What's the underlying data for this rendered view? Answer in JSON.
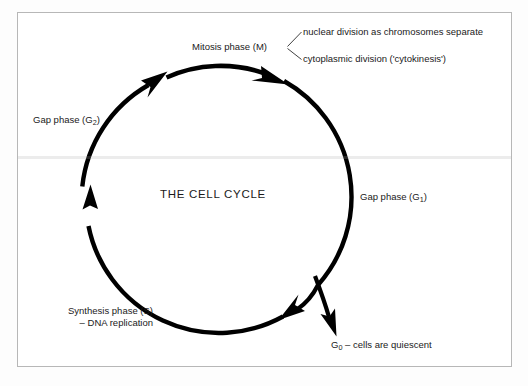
{
  "figure": {
    "title": "THE CELL CYCLE",
    "background_color": "#ffffff",
    "frame_color": "#b7b7b7",
    "stroke_color": "#000000"
  },
  "labels": {
    "mitosis": "Mitosis phase (M)",
    "nuclear_division": "nuclear division as chromosomes separate",
    "cytokinesis": "cytoplasmic division ('cytokinesis')",
    "gap_g2_text": "Gap phase (G",
    "gap_g2_sub": "2",
    "gap_g2_close": ")",
    "gap_g1_text": "Gap phase (G",
    "gap_g1_sub": "1",
    "gap_g1_close": ")",
    "synthesis_line1": "Synthesis phase (S)",
    "synthesis_line2": "– DNA replication",
    "g0_sub": "0",
    "g0_prefix": "G",
    "g0_text": "– cells are quiescent"
  },
  "diagram": {
    "type": "cycle",
    "center_x": 215,
    "center_y": 199,
    "radius": 133,
    "stroke_width": 4.2,
    "phases": [
      {
        "name": "Mitosis phase (M)",
        "symbol": "M",
        "arc_start_deg": 250,
        "arc_end_deg": 290
      },
      {
        "name": "Gap phase (G1)",
        "symbol": "G1",
        "arc_start_deg": 295,
        "arc_end_deg": 65
      },
      {
        "name": "Synthesis phase (S)",
        "symbol": "S",
        "arc_start_deg": 70,
        "arc_end_deg": 175
      },
      {
        "name": "Gap phase (G2)",
        "symbol": "G2",
        "arc_start_deg": 180,
        "arc_end_deg": 245
      }
    ],
    "branch": {
      "name": "G0",
      "label": "G0 – cells are quiescent",
      "direction": "exit-down-right"
    },
    "arrowheads": [
      "top-left-up-right",
      "top-right-down-right",
      "bottom-right-down-left",
      "left-up",
      "g0-branch-down"
    ]
  }
}
